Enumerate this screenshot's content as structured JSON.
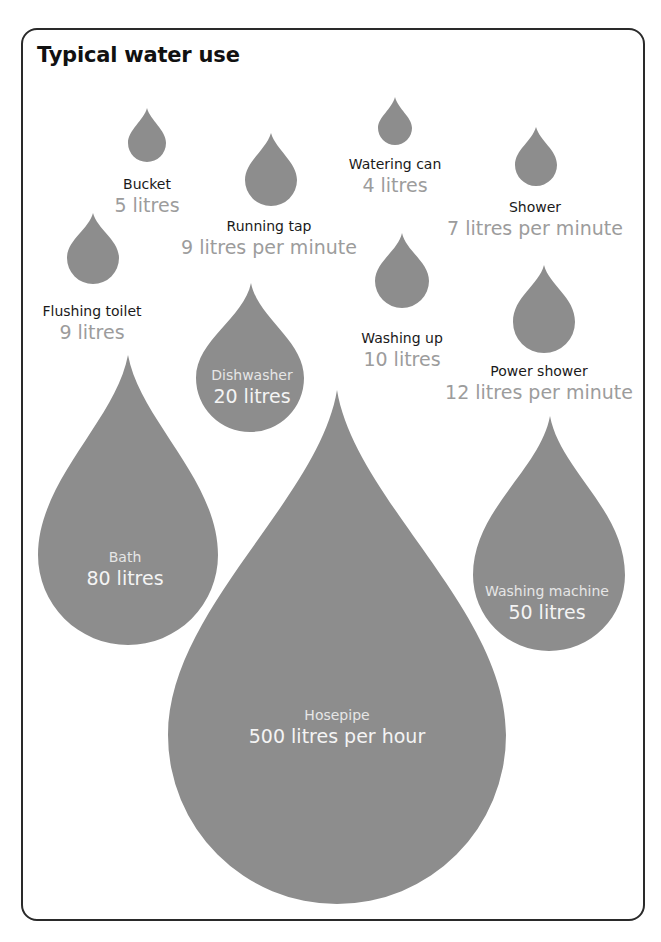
{
  "title": "Typical water use",
  "colors": {
    "drop": "#8d8d8d",
    "value_text": "#9c9c9c",
    "border": "#2a2a2a"
  },
  "items": [
    {
      "name": "Bucket",
      "value": "5 litres"
    },
    {
      "name": "Running tap",
      "value": "9 litres per minute"
    },
    {
      "name": "Watering can",
      "value": "4 litres"
    },
    {
      "name": "Shower",
      "value": "7 litres per minute"
    },
    {
      "name": "Flushing toilet",
      "value": "9 litres"
    },
    {
      "name": "Washing up",
      "value": "10 litres"
    },
    {
      "name": "Power shower",
      "value": "12 litres per minute"
    },
    {
      "name": "Dishwasher",
      "value": "20 litres"
    },
    {
      "name": "Bath",
      "value": "80 litres"
    },
    {
      "name": "Washing machine",
      "value": "50 litres"
    },
    {
      "name": "Hosepipe",
      "value": "500 litres per hour"
    }
  ]
}
